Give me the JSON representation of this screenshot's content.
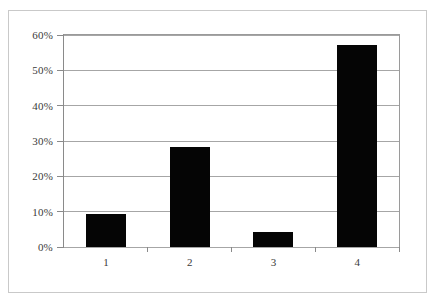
{
  "chart_data": {
    "type": "bar",
    "title": "",
    "subtitle": "",
    "xlabel": "",
    "ylabel": "",
    "categories": [
      "1",
      "2",
      "3",
      "4"
    ],
    "values": [
      9.3,
      28.2,
      4.2,
      57.2
    ],
    "value_format": "percent",
    "ylim": [
      0,
      60
    ],
    "ytick_labels": [
      "0%",
      "10%",
      "20%",
      "30%",
      "40%",
      "50%",
      "60%"
    ],
    "ytick_values": [
      0,
      10,
      20,
      30,
      40,
      50,
      60
    ],
    "grid": true,
    "grid_axis": "y",
    "legend": false,
    "legend_position": "none",
    "series": [
      {
        "name": "",
        "values": [
          9.3,
          28.2,
          4.2,
          57.2
        ]
      }
    ],
    "colors": {
      "bar": "#050505",
      "gridline": "#a6a6a6",
      "axis": "#8a8a8a",
      "frame": "#c9c9c9",
      "plot_background": "#ffffff",
      "figure_background": "#ffffff",
      "tick_label": "#3a3a3a"
    }
  }
}
